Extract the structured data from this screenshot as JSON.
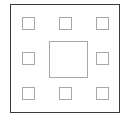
{
  "diagram": {
    "name": "square-pad-layout",
    "background_color": "#ffffff",
    "frame": {
      "label": "outer-frame",
      "stroke_color": "#3a3a3a",
      "fill_color": "#ffffff",
      "stroke_width": 1.5,
      "x": 10,
      "y": 4,
      "width": 110,
      "height": 109
    },
    "pad_style": {
      "stroke_color": "#a8a8a8",
      "fill_color": "#ffffff",
      "stroke_width": 1
    },
    "center_pad": {
      "label": "center-pad",
      "position": "center",
      "x": 48,
      "y": 40,
      "width": 39,
      "height": 37
    },
    "perimeter_pads": [
      {
        "label": "pad-top-left",
        "position": "top-left",
        "x": 21,
        "y": 16,
        "width": 13,
        "height": 13
      },
      {
        "label": "pad-top-center",
        "position": "top-center",
        "x": 58,
        "y": 16,
        "width": 13,
        "height": 13
      },
      {
        "label": "pad-top-right",
        "position": "top-right",
        "x": 95,
        "y": 16,
        "width": 13,
        "height": 13
      },
      {
        "label": "pad-middle-left",
        "position": "middle-left",
        "x": 21,
        "y": 51,
        "width": 13,
        "height": 13
      },
      {
        "label": "pad-middle-right",
        "position": "middle-right",
        "x": 95,
        "y": 51,
        "width": 13,
        "height": 13
      },
      {
        "label": "pad-bottom-left",
        "position": "bottom-left",
        "x": 21,
        "y": 86,
        "width": 13,
        "height": 13
      },
      {
        "label": "pad-bottom-center",
        "position": "bottom-center",
        "x": 58,
        "y": 86,
        "width": 13,
        "height": 13
      },
      {
        "label": "pad-bottom-right",
        "position": "bottom-right",
        "x": 95,
        "y": 86,
        "width": 13,
        "height": 13
      }
    ],
    "counts": {
      "perimeter_pads": 8,
      "center_pads": 1,
      "total_pads": 9
    }
  }
}
